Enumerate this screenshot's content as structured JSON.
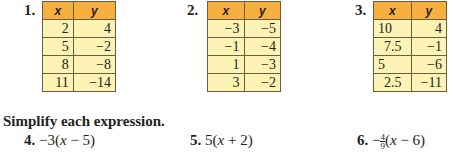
{
  "tables": [
    {
      "number": "1.",
      "headers": [
        "x",
        "y"
      ],
      "rows": [
        [
          "2",
          "4"
        ],
        [
          "5",
          "−2"
        ],
        [
          "8",
          "−8"
        ],
        [
          "11",
          "−14"
        ]
      ]
    },
    {
      "number": "2.",
      "headers": [
        "x",
        "y"
      ],
      "rows": [
        [
          "−3",
          "−5"
        ],
        [
          "−1",
          "−4"
        ],
        [
          "1",
          "−3"
        ],
        [
          "3",
          "−2"
        ]
      ]
    },
    {
      "number": "3.",
      "headers": [
        "x",
        "y"
      ],
      "rows": [
        [
          "10",
          "4"
        ],
        [
          "7.5",
          "−1"
        ],
        [
          "5",
          "−6"
        ],
        [
          "2.5",
          "−11"
        ]
      ]
    }
  ],
  "section": {
    "heading": "Simplify each expression."
  },
  "expressions": [
    {
      "number": "4.",
      "pre": "−3(",
      "var": "x",
      "post": " − 5)"
    },
    {
      "number": "5.",
      "pre": "5(",
      "var": "x",
      "post": " + 2)"
    },
    {
      "number": "6.",
      "sign": "−",
      "frac_num": "4",
      "frac_den": "9",
      "pre": "(",
      "var": "x",
      "post": " − 6)"
    }
  ],
  "colors": {
    "header_fill": "#f7b040",
    "cell_fill": "#fdf3b5",
    "border": "#6a5f3e"
  }
}
